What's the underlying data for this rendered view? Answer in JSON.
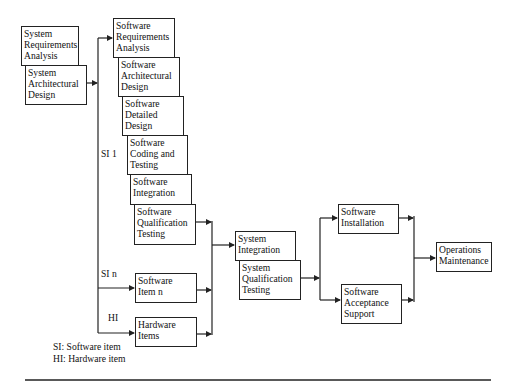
{
  "diagram": {
    "boxes": {
      "sys_req": "System\nRequirements\nAnalysis",
      "sys_arch": "System\nArchitectural\nDesign",
      "sw_req": "Software\nRequirements\nAnalysis",
      "sw_arch": "Software\nArchitectural\nDesign",
      "sw_detail": "Software\nDetailed\nDesign",
      "sw_code": "Software\nCoding and\nTesting",
      "sw_integ": "Software\nIntegration",
      "sw_qual": "Software\nQualification\nTesting",
      "sw_item_n": "Software\nItem n",
      "hw_items": "Hardware\nItems",
      "sys_integ": "System\nIntegration",
      "sys_qual": "System\nQualification\nTesting",
      "sw_install": "Software\nInstallation",
      "sw_accept": "Software\nAcceptance\nSupport",
      "ops_maint": "Operations\nMaintenance"
    },
    "branch_labels": {
      "si1": "SI 1",
      "sin": "SI n",
      "hi": "HI"
    },
    "legend": {
      "si": "SI: Software item",
      "hi": "HI: Hardware item"
    }
  }
}
